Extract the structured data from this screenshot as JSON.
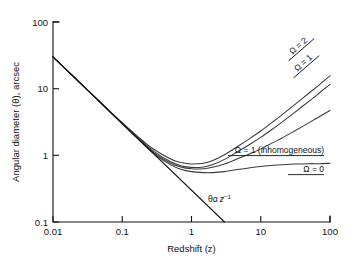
{
  "figure": {
    "background_color": "#ffffff",
    "line_color": "#3a3a3a",
    "axis_color": "#111111"
  },
  "chart_data": {
    "type": "line",
    "title": "",
    "subtitle": "",
    "xlabel": "Redshift (z)",
    "ylabel": "Angular diameter (θ), arcsec",
    "xscale": "log",
    "yscale": "log",
    "xlim": [
      0.01,
      100
    ],
    "ylim": [
      0.1,
      100
    ],
    "grid": false,
    "legend_position": "inline-curve-labels",
    "xticks": [
      0.01,
      0.1,
      1,
      10,
      100
    ],
    "xtick_labels": [
      "0.01",
      "0.1",
      "1",
      "10",
      "100"
    ],
    "yticks": [
      0.1,
      1,
      10,
      100
    ],
    "ytick_labels": [
      "0.1",
      "1",
      "10",
      "100"
    ],
    "series": [
      {
        "name": "Ω = 2",
        "label": "Ω = 2",
        "label_rotation": -40,
        "label_x": 40,
        "label_y": 22,
        "x": [
          0.01,
          0.02,
          0.03,
          0.05,
          0.07,
          0.1,
          0.15,
          0.2,
          0.3,
          0.5,
          0.7,
          1.0,
          1.5,
          2.0,
          3.0,
          5.0,
          7.0,
          10.0,
          15.0,
          20.0,
          30.0,
          50.0,
          70.0,
          100.0
        ],
        "y": [
          30.0,
          15.0,
          10.0,
          6.05,
          4.35,
          3.08,
          2.11,
          1.64,
          1.19,
          0.88,
          0.78,
          0.74,
          0.76,
          0.83,
          1.02,
          1.43,
          1.8,
          2.32,
          3.18,
          4.0,
          5.6,
          8.6,
          11.4,
          15.6
        ]
      },
      {
        "name": "Ω = 1",
        "label": "Ω = 1",
        "label_rotation": -40,
        "label_x": 45,
        "label_y": 38,
        "x": [
          0.01,
          0.02,
          0.03,
          0.05,
          0.07,
          0.1,
          0.15,
          0.2,
          0.3,
          0.5,
          0.7,
          1.0,
          1.5,
          2.0,
          3.0,
          5.0,
          7.0,
          10.0,
          15.0,
          20.0,
          30.0,
          50.0,
          70.0,
          100.0
        ],
        "y": [
          30.0,
          15.0,
          10.0,
          6.02,
          4.3,
          3.02,
          2.05,
          1.57,
          1.11,
          0.8,
          0.7,
          0.66,
          0.67,
          0.72,
          0.87,
          1.19,
          1.47,
          1.86,
          2.5,
          3.12,
          4.3,
          6.5,
          8.6,
          11.6
        ]
      },
      {
        "name": "Ω = 1 (inhomogeneous)",
        "label": "Ω = 1 (inhomogeneous)",
        "label_rotation": 0,
        "x": [
          0.01,
          0.02,
          0.03,
          0.05,
          0.07,
          0.1,
          0.15,
          0.2,
          0.3,
          0.5,
          0.7,
          1.0,
          1.5,
          2.0,
          3.0,
          5.0,
          7.0,
          10.0,
          15.0,
          20.0,
          30.0,
          50.0,
          70.0,
          100.0
        ],
        "y": [
          30.0,
          15.0,
          10.0,
          6.0,
          4.27,
          2.99,
          2.01,
          1.53,
          1.06,
          0.76,
          0.67,
          0.63,
          0.63,
          0.66,
          0.74,
          0.92,
          1.06,
          1.25,
          1.55,
          1.8,
          2.28,
          3.1,
          3.8,
          4.7
        ]
      },
      {
        "name": "Ω = 0",
        "label": "Ω = 0",
        "label_rotation": 0,
        "x": [
          0.01,
          0.02,
          0.03,
          0.05,
          0.07,
          0.1,
          0.15,
          0.2,
          0.3,
          0.5,
          0.7,
          1.0,
          1.5,
          2.0,
          3.0,
          5.0,
          7.0,
          10.0,
          15.0,
          20.0,
          30.0,
          50.0,
          70.0,
          100.0
        ],
        "y": [
          30.0,
          15.0,
          10.0,
          5.98,
          4.24,
          2.96,
          1.97,
          1.49,
          1.02,
          0.72,
          0.62,
          0.57,
          0.55,
          0.55,
          0.57,
          0.62,
          0.65,
          0.68,
          0.71,
          0.72,
          0.74,
          0.75,
          0.75,
          0.76
        ]
      }
    ],
    "reference_line": {
      "name": "θ ∝ z⁻¹",
      "label": "θ",
      "label_prop": "α",
      "label_var": "z",
      "label_exp": "−1",
      "x": [
        0.01,
        3.0
      ],
      "y": [
        30.0,
        0.1
      ]
    },
    "annotations": [
      {
        "text": "Ω = 2"
      },
      {
        "text": "Ω = 1"
      },
      {
        "text": "Ω = 1 (inhomogeneous)"
      },
      {
        "text": "Ω = 0"
      },
      {
        "text": "θα z⁻¹"
      }
    ]
  },
  "axes": {
    "x_title": "Redshift (z)",
    "y_title": "Angular diameter (θ), arcsec",
    "x_tick_0": "0.01",
    "x_tick_1": "0.1",
    "x_tick_2": "1",
    "x_tick_3": "10",
    "x_tick_4": "100",
    "y_tick_0": "0.1",
    "y_tick_1": "1",
    "y_tick_2": "10",
    "y_tick_3": "100"
  },
  "labels": {
    "omega2": "Ω = 2",
    "omega1": "Ω = 1",
    "omega1_inhomo": "Ω = 1 (inhomogeneous)",
    "omega0": "Ω = 0",
    "theta_symbol": "θ",
    "alpha_symbol": "α",
    "z_symbol": "z",
    "exponent": "−1"
  }
}
